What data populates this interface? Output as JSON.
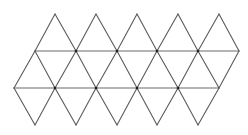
{
  "diagram": {
    "type": "icosahedron-net",
    "triangle_count": 20,
    "colors": {
      "line": "#5a5a5a",
      "horizontal": "#6a6a6a",
      "vertex": "#222222",
      "background": "#ffffff"
    },
    "rows_y": {
      "top": 14,
      "upper": 51,
      "lower": 88,
      "bottom": 125
    },
    "top_apex_x": [
      55,
      96,
      137,
      178,
      219
    ],
    "upper_row_x": [
      35,
      76,
      117,
      157,
      198,
      239
    ],
    "lower_row_x": [
      14,
      55,
      96,
      137,
      178,
      219
    ],
    "bottom_apex_x": [
      35,
      76,
      117,
      157,
      198
    ]
  }
}
